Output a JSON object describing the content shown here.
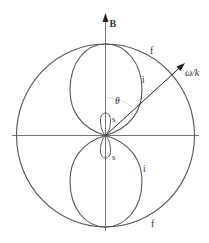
{
  "figure": {
    "type": "polar phase-velocity diagram",
    "colors": {
      "curve": "#555555",
      "axis": "#666666",
      "arrow": "#222222",
      "theta_arc": "#cccccc",
      "text": "#333333"
    },
    "labels": {
      "field": "B",
      "phase_velocity": "ω/k",
      "angle": "θ",
      "fast_upper": "f",
      "fast_lower": "f",
      "intermediate_upper": "i",
      "intermediate_lower": "i",
      "slow_upper": "s",
      "slow_lower": "s"
    },
    "curves": [
      {
        "name": "fast mode",
        "label": "f",
        "shape": "circle"
      },
      {
        "name": "intermediate mode",
        "label": "i",
        "shape": "two lobes along B"
      },
      {
        "name": "slow mode",
        "label": "s",
        "shape": "two small lobes along B"
      }
    ]
  }
}
